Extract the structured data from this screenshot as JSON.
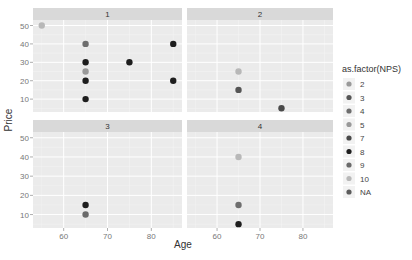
{
  "chart_data": {
    "type": "scatter",
    "title": "",
    "xlabel": "Age",
    "ylabel": "Price",
    "facet_by": "panel",
    "panels": [
      "1",
      "2",
      "3",
      "4"
    ],
    "xlim": [
      53,
      87
    ],
    "ylim": [
      3,
      53
    ],
    "xticks": [
      60,
      70,
      80
    ],
    "yticks": [
      10,
      20,
      30,
      40,
      50
    ],
    "grid": true,
    "legend_position": "right",
    "legend": {
      "title": "as.factor(NPS)",
      "entries": [
        {
          "label": "2",
          "color": "#9a9a9a"
        },
        {
          "label": "3",
          "color": "#555555"
        },
        {
          "label": "4",
          "color": "#6e6e6e"
        },
        {
          "label": "5",
          "color": "#999999"
        },
        {
          "label": "7",
          "color": "#4a4a4a"
        },
        {
          "label": "8",
          "color": "#1e1e1e"
        },
        {
          "label": "9",
          "color": "#6a6a6a"
        },
        {
          "label": "10",
          "color": "#b8b8b8"
        },
        {
          "label": "NA",
          "color": "#5c5c5c"
        }
      ]
    },
    "points": [
      {
        "panel": "1",
        "x": 55,
        "y": 50,
        "nps": "10"
      },
      {
        "panel": "1",
        "x": 65,
        "y": 40,
        "nps": "4"
      },
      {
        "panel": "1",
        "x": 65,
        "y": 30,
        "nps": "8"
      },
      {
        "panel": "1",
        "x": 65,
        "y": 25,
        "nps": "5"
      },
      {
        "panel": "1",
        "x": 65,
        "y": 20,
        "nps": "8"
      },
      {
        "panel": "1",
        "x": 65,
        "y": 10,
        "nps": "8"
      },
      {
        "panel": "1",
        "x": 75,
        "y": 30,
        "nps": "8"
      },
      {
        "panel": "1",
        "x": 85,
        "y": 40,
        "nps": "8"
      },
      {
        "panel": "1",
        "x": 85,
        "y": 20,
        "nps": "8"
      },
      {
        "panel": "2",
        "x": 65,
        "y": 25,
        "nps": "10"
      },
      {
        "panel": "2",
        "x": 65,
        "y": 15,
        "nps": "3"
      },
      {
        "panel": "2",
        "x": 75,
        "y": 5,
        "nps": "7"
      },
      {
        "panel": "3",
        "x": 65,
        "y": 15,
        "nps": "8"
      },
      {
        "panel": "3",
        "x": 65,
        "y": 10,
        "nps": "9"
      },
      {
        "panel": "4",
        "x": 65,
        "y": 40,
        "nps": "10"
      },
      {
        "panel": "4",
        "x": 65,
        "y": 15,
        "nps": "4"
      },
      {
        "panel": "4",
        "x": 65,
        "y": 5,
        "nps": "8"
      }
    ]
  },
  "colors": {
    "panel_bg": "#ebebeb",
    "strip_bg": "#d9d9d9",
    "grid_major": "#ffffff",
    "grid_minor": "#f4f4f4"
  }
}
